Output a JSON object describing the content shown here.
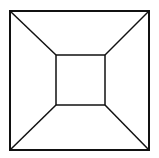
{
  "diagram": {
    "type": "nested-squares-frustum",
    "stroke_color": "#111111",
    "background": "#ffffff",
    "outer_square": {
      "x1": 10,
      "y1": 11,
      "x2": 149,
      "y2": 150
    },
    "inner_square": {
      "x1": 56,
      "y1": 55,
      "x2": 105,
      "y2": 105
    },
    "connectors": [
      {
        "name": "top-left",
        "from": [
          10,
          11
        ],
        "to": [
          56,
          55
        ]
      },
      {
        "name": "top-right",
        "from": [
          149,
          11
        ],
        "to": [
          105,
          55
        ]
      },
      {
        "name": "bottom-left",
        "from": [
          10,
          150
        ],
        "to": [
          56,
          105
        ]
      },
      {
        "name": "bottom-right",
        "from": [
          149,
          150
        ],
        "to": [
          105,
          105
        ]
      }
    ]
  }
}
